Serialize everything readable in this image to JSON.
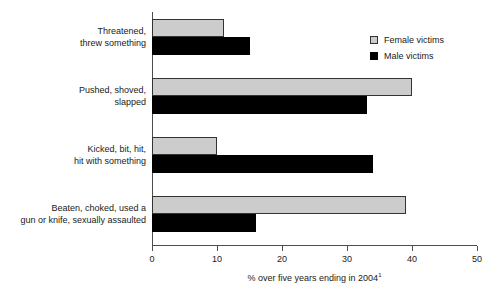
{
  "chart_data": {
    "type": "bar",
    "orientation": "horizontal",
    "title": "",
    "subtitle": "",
    "xlabel": "% over five years ending in 2004",
    "xlabel_footnote": "1",
    "ylabel": "",
    "xlim": [
      0,
      50
    ],
    "xticks": [
      0,
      10,
      20,
      30,
      40,
      50
    ],
    "xtick_labels": [
      "0",
      "10",
      "20",
      "30",
      "40",
      "50"
    ],
    "grid": false,
    "legend_position": "top-right",
    "categories": [
      "Threatened,\nthrew something",
      "Pushed, shoved,\nslapped",
      "Kicked, bit, hit,\nhit with something",
      "Beaten, choked, used a\ngun or knife, sexually assaulted"
    ],
    "category_lines": [
      [
        "Threatened,",
        "threw something"
      ],
      [
        "Pushed, shoved,",
        "slapped"
      ],
      [
        "Kicked, bit, hit,",
        "hit with something"
      ],
      [
        "Beaten, choked, used a",
        "gun or knife, sexually assaulted"
      ]
    ],
    "series": [
      {
        "name": "Female victims",
        "color": "#cccccc",
        "values": [
          11,
          40,
          10,
          39
        ]
      },
      {
        "name": "Male victims",
        "color": "#000000",
        "values": [
          15,
          33,
          34,
          16
        ]
      }
    ]
  },
  "legend": {
    "items": [
      {
        "label": "Female victims",
        "swatch": "female-swatch"
      },
      {
        "label": "Male victims",
        "swatch": "male-swatch"
      }
    ]
  },
  "axis": {
    "tick_labels": [
      "0",
      "10",
      "20",
      "30",
      "40",
      "50"
    ],
    "title": "% over five years ending in 2004",
    "title_footnote": "1"
  },
  "colors": {
    "female_fill": "#cccccc",
    "female_border": "#333333",
    "male_fill": "#000000",
    "axis_line": "#4d4d4d",
    "text": "#1a1a1a",
    "background": "#ffffff"
  }
}
